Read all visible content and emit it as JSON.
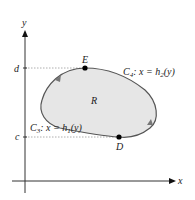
{
  "axes": {
    "x_label": "x",
    "y_label": "y"
  },
  "levels": {
    "d_label": "d",
    "c_label": "c"
  },
  "points": {
    "E": "E",
    "D": "D"
  },
  "region_label": "R",
  "curves": {
    "c4": {
      "name": "C",
      "sub": "4",
      "eq": ": x = h",
      "eq_sub": "2",
      "eq_end": "(y)"
    },
    "c3": {
      "name": "C",
      "sub": "3",
      "eq": ": x = h",
      "eq_sub": "1",
      "eq_end": "(y)"
    }
  },
  "colors": {
    "region_fill": "#e6e6e6",
    "boundary": "#555555",
    "axis": "#333333",
    "dotted": "#999999"
  }
}
